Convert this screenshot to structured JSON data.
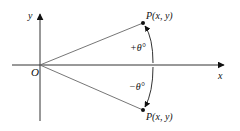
{
  "diagram": {
    "title": "",
    "axes": {
      "x_label": "x",
      "y_label": "y",
      "origin_label": "O"
    },
    "points": [
      {
        "id": "p-top",
        "label": "P(x, y)",
        "prefix": "P",
        "coords": "(x, y)"
      },
      {
        "id": "p-bottom",
        "label": "P(x, y)",
        "prefix": "P",
        "coords": "(x, y)"
      }
    ],
    "angles": [
      {
        "id": "positive",
        "label": "+θ°"
      },
      {
        "id": "negative",
        "label": "−θ°"
      }
    ],
    "colors": {
      "stroke": "#333333",
      "ray": "#666666",
      "text": "#111111",
      "background": "#ffffff"
    }
  }
}
